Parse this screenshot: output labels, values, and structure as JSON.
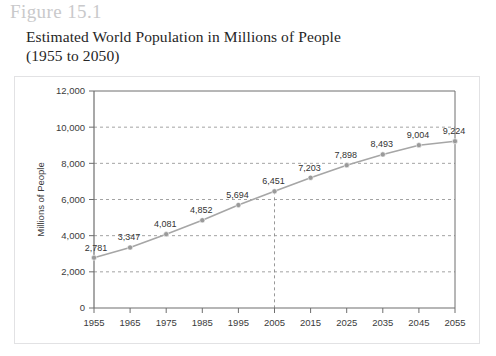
{
  "figure": {
    "number_label": "Figure 15.1"
  },
  "title": {
    "line1": "Estimated World Population in Millions of People",
    "line2": "(1955 to 2050)"
  },
  "colors": {
    "series_line": "#a6a6a6",
    "marker": "#9a9a9a",
    "gridline": "#8c8c8c",
    "axis": "#6e6e6e",
    "panel_border": "#e2e2e4",
    "figure_number": "#c9c9cb",
    "text": "#333333"
  },
  "chart_data": {
    "type": "line",
    "title": "Estimated World Population in Millions of People (1955 to 2050)",
    "xlabel": "",
    "ylabel": "Millions of People",
    "categories": [
      "1955",
      "1965",
      "1975",
      "1985",
      "1995",
      "2005",
      "2015",
      "2025",
      "2035",
      "2045",
      "2055"
    ],
    "values": [
      2781,
      3347,
      4081,
      4852,
      5694,
      6451,
      7203,
      7898,
      8493,
      9004,
      9224
    ],
    "point_labels": [
      "2,781",
      "3,347",
      "4,081",
      "4,852",
      "5,694",
      "6,451",
      "7,203",
      "7,898",
      "8,493",
      "9,004",
      "9,224"
    ],
    "ylim": [
      0,
      12000
    ],
    "ytick_values": [
      0,
      2000,
      4000,
      6000,
      8000,
      10000,
      12000
    ],
    "ytick_labels": [
      "0",
      "2,000",
      "4,000",
      "6,000",
      "8,000",
      "10,000",
      "12,000"
    ],
    "grid": true,
    "grid_style": "dashed-horizontal",
    "legend": "none",
    "annotations": [
      {
        "name": "reference-line-2005",
        "type": "vertical-dashed-line",
        "x_category": "2005",
        "from_value": 0,
        "to_value": 6451
      }
    ]
  }
}
